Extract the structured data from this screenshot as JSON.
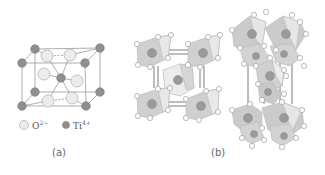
{
  "panels": [
    {
      "id": "a",
      "label": "(a)"
    },
    {
      "id": "b",
      "label": "(b)"
    }
  ],
  "legend": {
    "items": [
      {
        "symbol": "O",
        "charge": "2−",
        "kind": "oxygen",
        "color": "#ececec"
      },
      {
        "symbol": "Ti",
        "charge": "4+",
        "kind": "titanium",
        "color": "#8f8f8f"
      }
    ]
  },
  "colors": {
    "bond": "#8a8a8a",
    "octahedron_fill": "#c9c9c9",
    "octahedron_light": "#e6e6e6",
    "atom_dark": "#8f8f8f",
    "atom_light": "#ececec"
  }
}
